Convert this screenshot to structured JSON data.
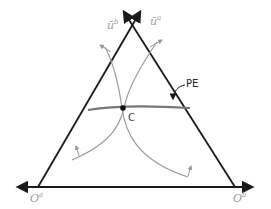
{
  "diagram": {
    "type": "edgeworth-box-triangle",
    "labels": {
      "utility_b": {
        "base": "ū",
        "sup": "b"
      },
      "utility_a": {
        "base": "ū",
        "sup": "a"
      },
      "pareto_efficient": "PE",
      "contract_point": "C",
      "origin_a": {
        "base": "O",
        "sup": "a"
      },
      "origin_b": {
        "base": "O",
        "sup": "b"
      }
    },
    "colors": {
      "axes": "#1a1a1a",
      "curves": "#9a9a9a",
      "pe_curve": "#777777",
      "point": "#111111"
    }
  }
}
